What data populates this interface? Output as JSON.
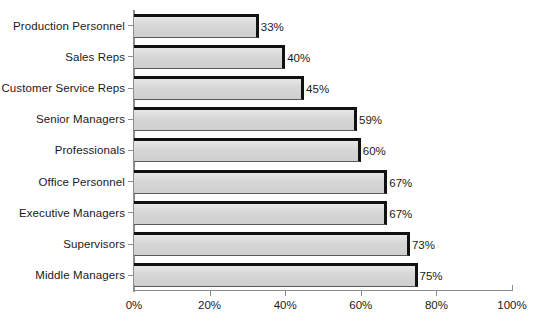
{
  "chart_data": {
    "type": "bar",
    "orientation": "horizontal",
    "title": "",
    "xlabel": "",
    "ylabel": "",
    "xlim": [
      0,
      100
    ],
    "xticks": [
      "0%",
      "20%",
      "40%",
      "60%",
      "80%",
      "100%"
    ],
    "xtick_values": [
      0,
      20,
      40,
      60,
      80,
      100
    ],
    "grid": false,
    "legend": false,
    "value_suffix": "%",
    "categories": [
      "Production Personnel",
      "Sales Reps",
      "Customer Service Reps",
      "Senior Managers",
      "Professionals",
      "Office Personnel",
      "Executive Managers",
      "Supervisors",
      "Middle Managers"
    ],
    "values": [
      33,
      40,
      45,
      59,
      60,
      67,
      67,
      73,
      75
    ],
    "data_labels": [
      "33%",
      "40%",
      "45%",
      "59%",
      "60%",
      "67%",
      "67%",
      "73%",
      "75%"
    ],
    "colors": {
      "bar_fill": "#d6d6d6",
      "bar_outline": "#111111",
      "axis": "#8d8d8d",
      "text": "#1a1a1a",
      "background": "#ffffff"
    }
  }
}
